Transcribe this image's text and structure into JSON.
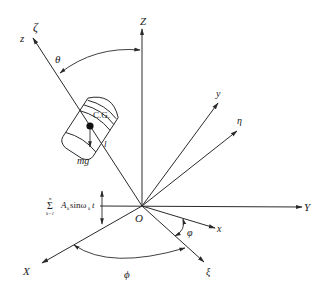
{
  "figure": {
    "origin_label": "O",
    "axes": {
      "Z": "Z",
      "Y": "Y",
      "X": "X",
      "z": "z",
      "zeta": "ζ",
      "y": "y",
      "eta": "η",
      "x": "x",
      "xi": "ξ"
    },
    "angles": {
      "theta": "θ",
      "phi_small": "φ",
      "phi_large": "ϕ"
    },
    "body": {
      "cg_label": "C.G.",
      "length_label": "l",
      "weight_label": "mg"
    },
    "excitation": {
      "sum_top": "n",
      "sum_bottom": "k=1",
      "sum_symbol": "Σ",
      "term": "A",
      "term_sub": "k",
      "func": "sinω",
      "func_sub": "k",
      "var": "t"
    },
    "colors": {
      "stroke": "#2a2a2a",
      "background": "#ffffff"
    }
  }
}
